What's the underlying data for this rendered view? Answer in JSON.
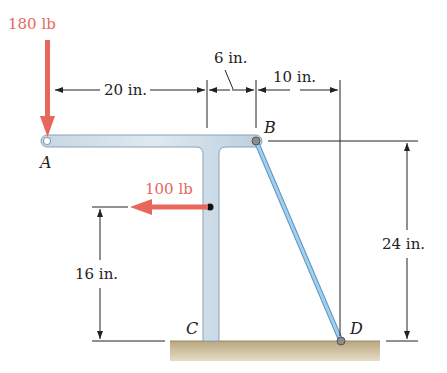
{
  "diagram": {
    "forces": [
      {
        "id": "force-a",
        "label": "180 lb",
        "direction": "down"
      },
      {
        "id": "force-mid",
        "label": "100 lb",
        "direction": "left"
      }
    ],
    "points": {
      "A": "A",
      "B": "B",
      "C": "C",
      "D": "D"
    },
    "dimensions": {
      "a_to_post": "20 in.",
      "post_to_b": "6 in.",
      "b_to_d": "10 in.",
      "force_height": "16 in.",
      "b_height": "24 in."
    },
    "colors": {
      "force": "#e8675b",
      "member_fill": "#cfdde8",
      "member_stroke": "#8aa3b5",
      "rod": "#8ec3e6",
      "ground": "#c9b895",
      "line": "#222222"
    }
  }
}
